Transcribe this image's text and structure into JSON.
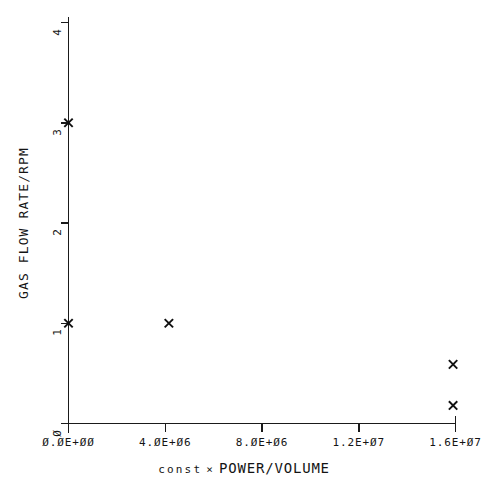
{
  "chart_data": {
    "type": "scatter",
    "title": "",
    "xlabel_prefix": "const",
    "xlabel_times": "×",
    "xlabel_main": "POWER/VOLUME",
    "xlabel": "const × POWER/VOLUME",
    "ylabel": "GAS FLOW RATE/RPM",
    "xlim": [
      0,
      16000000
    ],
    "ylim": [
      0,
      4
    ],
    "grid": false,
    "legend": "none",
    "marker": "x",
    "xticks": [
      0,
      4000000,
      8000000,
      12000000,
      16000000
    ],
    "xtick_labels": [
      "Ø.ØE+ØØ",
      "4.ØE+Ø6",
      "8.ØE+Ø6",
      "1.2E+Ø7",
      "1.6E+Ø7"
    ],
    "yticks": [
      0,
      1,
      2,
      3,
      4
    ],
    "ytick_labels": [
      "Ø",
      "1",
      "2",
      "3",
      "4"
    ],
    "points": [
      {
        "x": 0,
        "y": 3
      },
      {
        "x": 0,
        "y": 1
      },
      {
        "x": 4150000,
        "y": 1
      },
      {
        "x": 15900000,
        "y": 0.59
      },
      {
        "x": 15900000,
        "y": 0.18
      }
    ],
    "colors": {
      "axis": "#1a1a1a",
      "marker": "#101010",
      "background": "#ffffff",
      "text": "#141414"
    }
  }
}
